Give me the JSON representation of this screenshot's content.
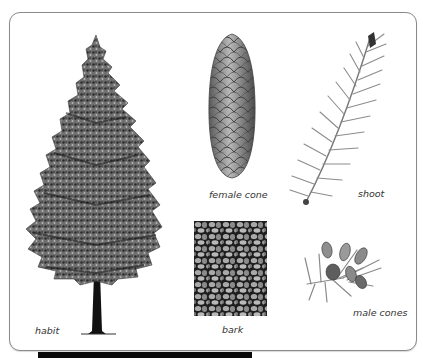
{
  "figure": {
    "panels": [
      {
        "id": "habit",
        "label": "habit"
      },
      {
        "id": "female-cone",
        "label": "female cone"
      },
      {
        "id": "shoot",
        "label": "shoot"
      },
      {
        "id": "bark",
        "label": "bark"
      },
      {
        "id": "male-cones",
        "label": "male cones"
      }
    ]
  },
  "colors": {
    "frame_border": "#8a8a8a",
    "background": "#ffffff",
    "bottom_bar": "#0a0a0a",
    "label_text": "#333333"
  }
}
